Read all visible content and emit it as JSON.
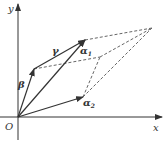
{
  "diagram": {
    "axes": {
      "x_label": "x",
      "y_label": "y",
      "origin_label": "O"
    },
    "vectors": [
      {
        "id": "alpha1",
        "label": "α",
        "subscript": "1"
      },
      {
        "id": "alpha2",
        "label": "α",
        "subscript": "2"
      },
      {
        "id": "beta",
        "label": "β",
        "subscript": ""
      },
      {
        "id": "gamma",
        "label": "γ",
        "subscript": ""
      }
    ],
    "colors": {
      "line": "#333333",
      "dashed": "#555555"
    }
  }
}
